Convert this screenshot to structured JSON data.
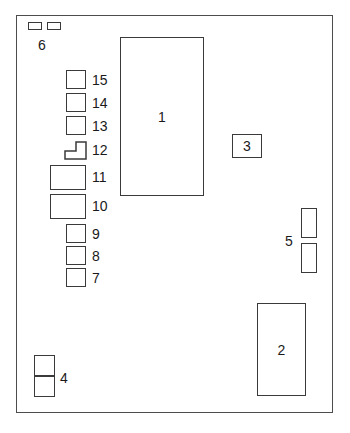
{
  "diagram": {
    "type": "fuse-relay-panel-schematic",
    "background_color": "#ffffff",
    "line_color": "#3a3a3a",
    "panel": {
      "label": "fuse panel enclosure",
      "x": 16,
      "y": 15,
      "width": 317,
      "height": 398
    },
    "components": [
      {
        "id": "1",
        "label": "1",
        "shape": "rectangle",
        "label_position": "inside",
        "x": 120,
        "y": 37,
        "width": 84,
        "height": 159
      },
      {
        "id": "2",
        "label": "2",
        "shape": "rectangle",
        "label_position": "inside",
        "x": 257,
        "y": 303,
        "width": 49,
        "height": 93
      },
      {
        "id": "3",
        "label": "3",
        "shape": "rectangle",
        "label_position": "inside",
        "x": 232,
        "y": 134,
        "width": 30,
        "height": 24
      },
      {
        "id": "4",
        "label": "4",
        "shape": "stacked-squares-2",
        "label_position": "right",
        "x": 34,
        "y": 355,
        "width": 21,
        "height": 42
      },
      {
        "id": "5",
        "label": "5",
        "shape": "stacked-vertical-bars-2",
        "label_position": "left",
        "x": 301,
        "y": 208,
        "width": 16,
        "height": 65
      },
      {
        "id": "6",
        "label": "6",
        "shape": "paired-horizontal-bars-2",
        "label_position": "below",
        "x": 28,
        "y": 22,
        "width": 33,
        "height": 8
      },
      {
        "id": "7",
        "label": "7",
        "shape": "square",
        "label_position": "right",
        "x": 66,
        "y": 268,
        "width": 20,
        "height": 19
      },
      {
        "id": "8",
        "label": "8",
        "shape": "square",
        "label_position": "right",
        "x": 66,
        "y": 246,
        "width": 20,
        "height": 19
      },
      {
        "id": "9",
        "label": "9",
        "shape": "square",
        "label_position": "right",
        "x": 66,
        "y": 224,
        "width": 20,
        "height": 19
      },
      {
        "id": "10",
        "label": "10",
        "shape": "wide-rectangle",
        "label_position": "right",
        "x": 50,
        "y": 194,
        "width": 36,
        "height": 25
      },
      {
        "id": "11",
        "label": "11",
        "shape": "wide-rectangle",
        "label_position": "right",
        "x": 50,
        "y": 165,
        "width": 36,
        "height": 25
      },
      {
        "id": "12",
        "label": "12",
        "shape": "l-shape",
        "label_position": "right",
        "x": 64,
        "y": 141,
        "width": 22,
        "height": 19
      },
      {
        "id": "13",
        "label": "13",
        "shape": "square",
        "label_position": "right",
        "x": 66,
        "y": 116,
        "width": 20,
        "height": 19
      },
      {
        "id": "14",
        "label": "14",
        "shape": "square",
        "label_position": "right",
        "x": 66,
        "y": 93,
        "width": 20,
        "height": 19
      },
      {
        "id": "15",
        "label": "15",
        "shape": "square",
        "label_position": "right",
        "x": 66,
        "y": 70,
        "width": 20,
        "height": 19
      }
    ]
  }
}
